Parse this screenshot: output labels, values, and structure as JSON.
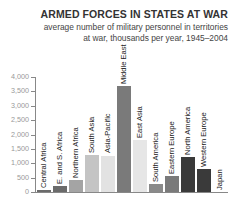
{
  "chart_data": {
    "type": "bar",
    "title": "ARMED FORCES IN STATES AT WAR",
    "subtitle_line1": "average number of military personnel in territories",
    "subtitle_line2": "at war, thousands per year, 1945–2004",
    "xlabel": "",
    "ylabel": "",
    "ylim": [
      0,
      4000
    ],
    "yticks": [
      "4,000",
      "3,500",
      "3,000",
      "2,500",
      "2,000",
      "1,500",
      "1,000",
      "500",
      "0"
    ],
    "grid": false,
    "legend": null,
    "categories": [
      "Central Africa",
      "E. and S. Africa",
      "Northern Africa",
      "South Asia",
      "Asia-Pacific",
      "Middle East",
      "East Asia",
      "South America",
      "Eastern Europe",
      "North America",
      "Western Europe",
      "Japan"
    ],
    "values": [
      80,
      200,
      420,
      1300,
      1270,
      3680,
      1800,
      280,
      560,
      1220,
      800,
      0
    ],
    "colors": [
      "#6b6b6b",
      "#6b6b6b",
      "#a4a4a4",
      "#c4c4c4",
      "#e2e2e2",
      "#7a7a7a",
      "#e6e6e6",
      "#8a8a8a",
      "#7a7a7a",
      "#3a3a3a",
      "#3a3a3a",
      "#3a3a3a"
    ]
  }
}
